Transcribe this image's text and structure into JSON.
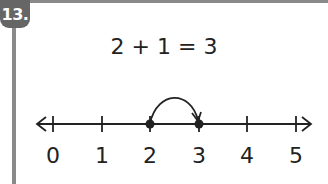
{
  "problem": {
    "number": "13.",
    "equation": "2 + 1 = 3"
  },
  "number_line": {
    "ticks": [
      "0",
      "1",
      "2",
      "3",
      "4",
      "5"
    ],
    "points": [
      2,
      3
    ],
    "jump": {
      "from": 2,
      "to": 3
    }
  },
  "colors": {
    "frame": "#8a8a8a",
    "badge": "#666666",
    "ink": "#222222"
  }
}
